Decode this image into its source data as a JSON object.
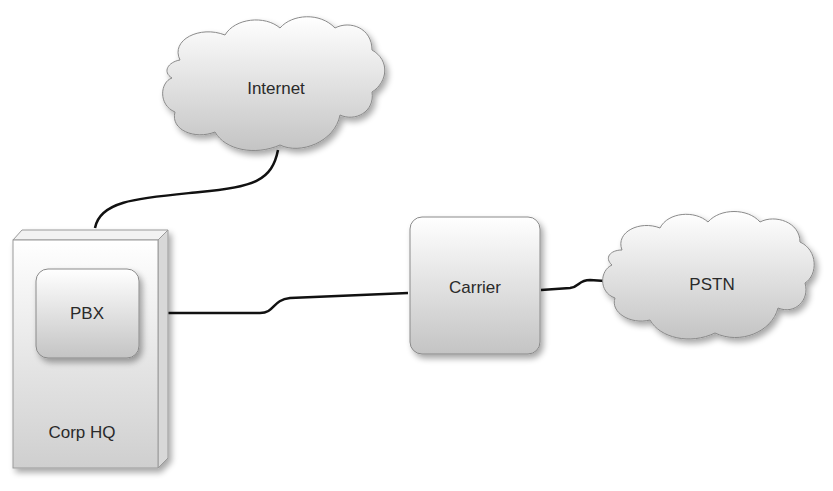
{
  "diagram": {
    "nodes": {
      "internet": {
        "label": "Internet",
        "shape": "cloud"
      },
      "corp_hq": {
        "label": "Corp HQ",
        "shape": "3d-box"
      },
      "pbx": {
        "label": "PBX",
        "shape": "rounded-rect"
      },
      "carrier": {
        "label": "Carrier",
        "shape": "rounded-rect"
      },
      "pstn": {
        "label": "PSTN",
        "shape": "cloud"
      }
    },
    "edges": [
      {
        "from": "corp_hq",
        "to": "internet"
      },
      {
        "from": "pbx",
        "to": "carrier"
      },
      {
        "from": "carrier",
        "to": "pstn"
      }
    ]
  }
}
